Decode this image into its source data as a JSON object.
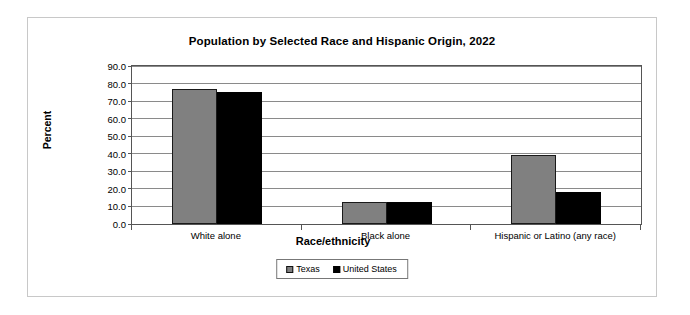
{
  "chart_data": {
    "type": "bar",
    "title": "Population by Selected Race and Hispanic Origin, 2022",
    "xlabel": "Race/ethnicity",
    "ylabel": "Percent",
    "categories": [
      "White alone",
      "Black alone",
      "Hispanic or Latino (any race)"
    ],
    "series": [
      {
        "name": "Texas",
        "color": "#808080",
        "values": [
          77.0,
          12.4,
          39.5
        ]
      },
      {
        "name": "United States",
        "color": "#000000",
        "values": [
          75.3,
          12.4,
          18.0
        ]
      }
    ],
    "ylim": [
      0,
      90
    ],
    "yticks": [
      "0.0",
      "10.0",
      "20.0",
      "30.0",
      "40.0",
      "50.0",
      "60.0",
      "70.0",
      "80.0",
      "90.0"
    ],
    "ytick_values": [
      0,
      10,
      20,
      30,
      40,
      50,
      60,
      70,
      80,
      90
    ],
    "grid": true,
    "legend_position": "bottom"
  }
}
